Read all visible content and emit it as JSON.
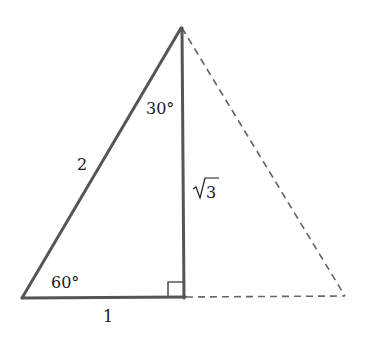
{
  "diagram": {
    "type": "triangle-30-60-90",
    "colors": {
      "stroke": "#555555",
      "dashed": "#666666",
      "text": "#1a1a1a",
      "background": "#ffffff"
    },
    "vertices": {
      "apex": [
        181,
        28
      ],
      "bottom_left": [
        22,
        298
      ],
      "right_angle": [
        184,
        297
      ],
      "mirror_right": [
        345,
        296
      ]
    },
    "labels": {
      "hypotenuse": "2",
      "short_leg": "1",
      "long_leg_radical": "√",
      "long_leg_value": "3",
      "top_angle": "30°",
      "bottom_angle": "60°"
    }
  }
}
